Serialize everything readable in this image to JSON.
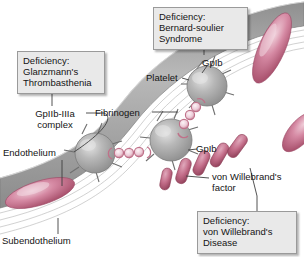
{
  "figure": {
    "background_color": "#ffffff"
  },
  "callout_boxes": [
    {
      "id": "glanzmann",
      "text": "Deficiency:\nGlanzmann's\nThrombasthenia",
      "points_to": "GpIIb-IIIa complex",
      "fill": "#e9e9e9",
      "border": "#9a9a9a"
    },
    {
      "id": "bernard_soulier",
      "text": "Deficiency:\nBernard-soulier\nSyndrome",
      "points_to": "GpIb",
      "fill": "#e9e9e9",
      "border": "#9a9a9a"
    },
    {
      "id": "von_willebrand_disease",
      "text": "Deficiency:\nvon Willebrand's\nDisease",
      "points_to": "von Willebrand's factor",
      "fill": "#e9e9e9",
      "border": "#9a9a9a"
    }
  ],
  "labels": {
    "gp2b3a_complex": "GpIIb-IIIa\ncomplex",
    "endothelium": "Endothelium",
    "subendothelium": "Subendothelium",
    "platelet": "Platelet",
    "gpib_top": "GpIb",
    "gpib_middle": "GpIb",
    "fibrinogen": "Fibrinogen",
    "von_willebrand_factor": "von Willebrand's\nfactor"
  },
  "structures": {
    "platelets": {
      "name": "platelet",
      "count": 3,
      "color": "#a8a8a8",
      "highlight": "#d8d8d8",
      "shape": "sphere-with-pseudopods"
    },
    "fibrinogen_bridges": {
      "name": "fibrinogen",
      "count": 2,
      "bead_color": "#d4839c",
      "bead_fill": "#f2e2e8",
      "beads_per_bridge": 3
    },
    "vwf_molecules": {
      "name": "von-willebrand-factor",
      "count": 4,
      "color": "#c2627f",
      "shape": "rounded-rod"
    },
    "endothelial_cells": {
      "name": "endothelial-cell",
      "count": 2,
      "color": "#c96f8c",
      "shape": "elongated-oval"
    },
    "vessel_wall": {
      "band_color": "#9e9e9e",
      "band_light": "#cfcfcf",
      "subendothelium_fibril_color": "#ffffff"
    }
  },
  "colors": {
    "pink": "#c96f8c",
    "gray": "#a8a8a8",
    "box_fill": "#e9e9e9",
    "box_border": "#9a9a9a",
    "leader_line": "#4a4a4a"
  }
}
